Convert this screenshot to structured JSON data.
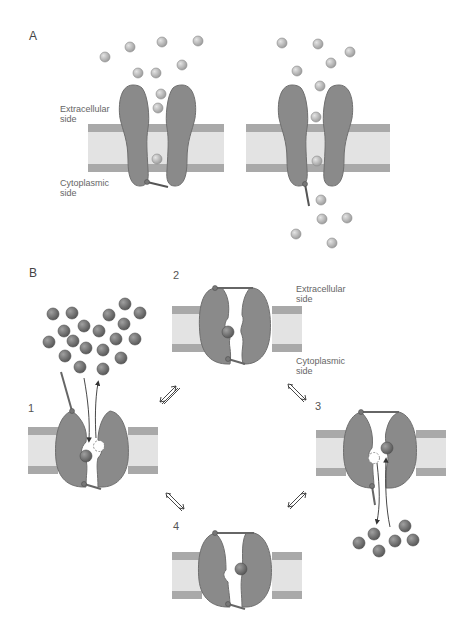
{
  "colors": {
    "protein": "#8a8a8a",
    "protein_stroke": "#6f6f6f",
    "membrane_band": "#a9a9a9",
    "membrane_core": "#e3e3e3",
    "ion_light": "#b8b8b8",
    "ion_dark": "#6e6e6e",
    "text": "#666666"
  },
  "panel_a": {
    "label": "A",
    "extracellular_label": "Extracellular\nside",
    "cytoplasmic_label": "Cytoplasmic\nside",
    "channels": [
      {
        "state": "closed",
        "gate": "closed"
      },
      {
        "state": "open",
        "gate": "open"
      }
    ]
  },
  "panel_b": {
    "label": "B",
    "extracellular_label": "Extracellular\nside",
    "cytoplasmic_label": "Cytoplasmic\nside",
    "states": [
      {
        "number": "1",
        "description": "outer gate open, ion exchange with extracellular side"
      },
      {
        "number": "2",
        "description": "both gates closed, ion occluded"
      },
      {
        "number": "3",
        "description": "inner gate open, ion exchange with cytoplasmic side"
      },
      {
        "number": "4",
        "description": "both gates closed, ion occluded"
      }
    ],
    "transitions": [
      "1 ⇌ 2",
      "2 ⇌ 3",
      "3 ⇌ 4",
      "4 ⇌ 1"
    ]
  }
}
